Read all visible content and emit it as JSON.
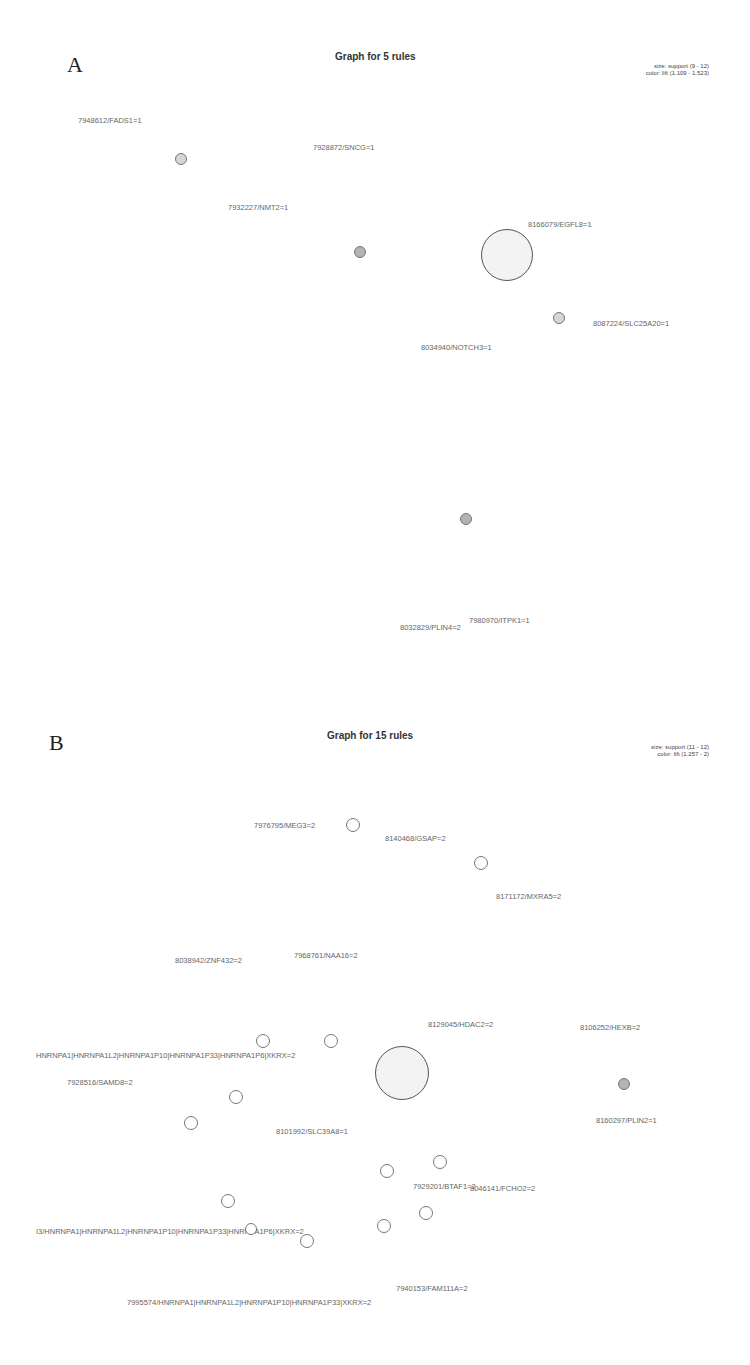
{
  "panels": [
    {
      "letter": "A",
      "title": "Graph for 5 rules",
      "legend": {
        "size": "size: support (9 - 12)",
        "color": "color: lift (1.109 - 1.523)"
      },
      "labels": [
        {
          "text": "7948612/FADS1=1",
          "x": 78,
          "y": 116
        },
        {
          "text": "7928872/SNCG=1",
          "x": 313,
          "y": 143
        },
        {
          "text": "7932227/NMT2=1",
          "x": 228,
          "y": 203
        },
        {
          "text": "8166079/EGFL8=1",
          "x": 528,
          "y": 220
        },
        {
          "text": "8087224/SLC25A20=1",
          "x": 593,
          "y": 319
        },
        {
          "text": "8034940/NOTCH3=1",
          "x": 421,
          "y": 343
        },
        {
          "text": "7980970/ITPK1=1",
          "x": 469,
          "y": 616
        },
        {
          "text": "8032829/PLIN4=2",
          "x": 400,
          "y": 623
        }
      ],
      "nodes": [
        {
          "x": 181,
          "y": 159,
          "r": 6,
          "style": "filled-light"
        },
        {
          "x": 360,
          "y": 252,
          "r": 6,
          "style": "filled-mid"
        },
        {
          "x": 507,
          "y": 255,
          "r": 26,
          "style": "big"
        },
        {
          "x": 559,
          "y": 318,
          "r": 6,
          "style": "filled-light"
        },
        {
          "x": 466,
          "y": 519,
          "r": 6,
          "style": "filled-mid"
        }
      ]
    },
    {
      "letter": "B",
      "title": "Graph for 15 rules",
      "legend": {
        "size": "size: support (11 - 12)",
        "color": "color: lift (1.257 - 2)"
      },
      "labels": [
        {
          "text": "7976795/MEG3=2",
          "x": 254,
          "y": 121
        },
        {
          "text": "8140468/GSAP=2",
          "x": 385,
          "y": 134
        },
        {
          "text": "8171172/MXRA5=2",
          "x": 496,
          "y": 192
        },
        {
          "text": "8038942/ZNF432=2",
          "x": 175,
          "y": 256
        },
        {
          "text": "7968761/NAA16=2",
          "x": 294,
          "y": 251
        },
        {
          "text": "8129045/HDAC2=2",
          "x": 428,
          "y": 320
        },
        {
          "text": "8106252/HEXB=2",
          "x": 580,
          "y": 323
        },
        {
          "text": "HNRNPA1|HNRNPA1L2|HNRNPA1P10|HNRNPA1P33|HNRNPA1P6|XKRX=2",
          "x": 36,
          "y": 351,
          "prefix": "/R"
        },
        {
          "text": "7928516/SAMD8=2",
          "x": 67,
          "y": 378
        },
        {
          "text": "8160297/PLIN2=1",
          "x": 596,
          "y": 416
        },
        {
          "text": "8101992/SLC39A8=1",
          "x": 276,
          "y": 427
        },
        {
          "text": "7929201/BTAF1=2",
          "x": 413,
          "y": 482
        },
        {
          "text": "8046141/FCHO2=2",
          "x": 470,
          "y": 484
        },
        {
          "text": "I3/HNRNPA1|HNRNPA1L2|HNRNPA1P10|HNRNPA1P33|HNRNPA1P6|XKRX=2",
          "x": 36,
          "y": 527
        },
        {
          "text": "7940153/FAM111A=2",
          "x": 396,
          "y": 584
        },
        {
          "text": "7995574/HNRNPA1|HNRNPA1L2|HNRNPA1P10|HNRNPA1P33|XKRX=2",
          "x": 127,
          "y": 598
        }
      ],
      "nodes": [
        {
          "x": 353,
          "y": 125,
          "r": 7,
          "style": "empty"
        },
        {
          "x": 481,
          "y": 163,
          "r": 7,
          "style": "empty"
        },
        {
          "x": 263,
          "y": 341,
          "r": 7,
          "style": "empty"
        },
        {
          "x": 331,
          "y": 341,
          "r": 7,
          "style": "empty"
        },
        {
          "x": 402,
          "y": 373,
          "r": 27,
          "style": "big"
        },
        {
          "x": 624,
          "y": 384,
          "r": 6,
          "style": "filled-mid"
        },
        {
          "x": 236,
          "y": 397,
          "r": 7,
          "style": "empty"
        },
        {
          "x": 191,
          "y": 423,
          "r": 7,
          "style": "empty"
        },
        {
          "x": 440,
          "y": 462,
          "r": 7,
          "style": "empty"
        },
        {
          "x": 387,
          "y": 471,
          "r": 7,
          "style": "empty"
        },
        {
          "x": 228,
          "y": 501,
          "r": 7,
          "style": "empty"
        },
        {
          "x": 426,
          "y": 513,
          "r": 7,
          "style": "empty"
        },
        {
          "x": 251,
          "y": 529,
          "r": 6,
          "style": "empty"
        },
        {
          "x": 384,
          "y": 526,
          "r": 7,
          "style": "empty"
        },
        {
          "x": 307,
          "y": 541,
          "r": 7,
          "style": "empty"
        }
      ]
    }
  ]
}
